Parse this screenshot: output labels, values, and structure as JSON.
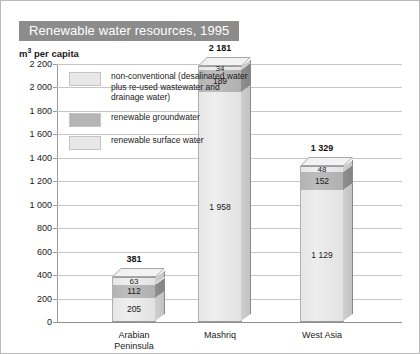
{
  "header": {
    "title": "Renewable water resources, 1995"
  },
  "axis": {
    "unit_label_prefix": "m",
    "unit_label_sup": "3",
    "unit_label_suffix": " per capita"
  },
  "legend": {
    "items": [
      {
        "name": "non-conventional",
        "label": "non-conventional (desalinated water plus re-used wastewater and drainage water)",
        "color": "#e8e8e8"
      },
      {
        "name": "renewable-groundwater",
        "label": "renewable groundwater",
        "color": "#b5b5b5"
      },
      {
        "name": "renewable-surface-water",
        "label": "renewable surface water",
        "color": "#e8e8e8"
      }
    ]
  },
  "chart_data": {
    "type": "bar",
    "stacked": true,
    "title": "Renewable water resources, 1995",
    "xlabel": "",
    "ylabel": "m3 per capita",
    "ylim": [
      0,
      2200
    ],
    "ytick_step": 200,
    "ytick_labels": [
      "2 200",
      "2 000",
      "1 800",
      "1 600",
      "1 400",
      "1 200",
      "1 000",
      "800",
      "600",
      "400",
      "200",
      "0"
    ],
    "ytick_values": [
      2200,
      2000,
      1800,
      1600,
      1400,
      1200,
      1000,
      800,
      600,
      400,
      200,
      0
    ],
    "grid": true,
    "legend_position": "inside-upper-left",
    "categories": [
      "Arabian Peninsula",
      "Mashriq",
      "West Asia"
    ],
    "category_labels": [
      [
        "Arabian",
        "Peninsula"
      ],
      [
        "Mashriq"
      ],
      [
        "West Asia"
      ]
    ],
    "series": [
      {
        "name": "renewable surface water",
        "values": [
          205,
          1958,
          1129
        ],
        "value_labels": [
          "205",
          "1 958",
          "1 129"
        ]
      },
      {
        "name": "renewable groundwater",
        "values": [
          112,
          189,
          152
        ],
        "value_labels": [
          "112",
          "189",
          "152"
        ]
      },
      {
        "name": "non-conventional",
        "values": [
          63,
          34,
          48
        ],
        "value_labels": [
          "63",
          "34",
          "48"
        ]
      }
    ],
    "totals": [
      381,
      2181,
      1329
    ],
    "total_labels": [
      "381",
      "2 181",
      "1 329"
    ]
  },
  "colors": {
    "title_bar_bg": "#8c8c8c",
    "title_text": "#ffffff",
    "surface_water": "#e8e8e8",
    "groundwater": "#b5b5b5",
    "non_conventional": "#e8e8e8",
    "gridline": "#c6c6c6",
    "axis": "#8f8f8f",
    "page_border": "#b9b9b9"
  }
}
